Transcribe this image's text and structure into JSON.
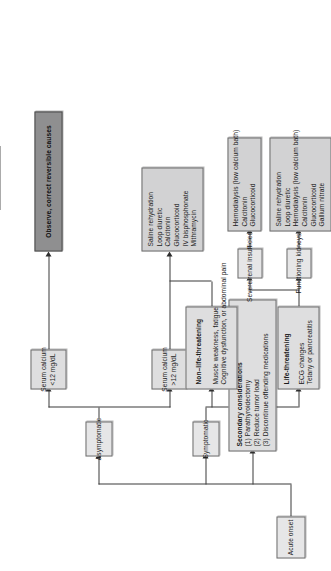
{
  "figure": {
    "orientation": "rotated-90-ccw",
    "colors": {
      "node_fill": "#dededf",
      "node_fill_light": "#e6e6e7",
      "node_fill_dark": "#8f8f90",
      "border": "#6e6e6e",
      "connector": "#3a3a3a",
      "page_edge_bar": "#565656",
      "text": "#1b1b1b"
    }
  },
  "nodes": {
    "acute_onset": {
      "id": "acute-onset",
      "lines": [
        "Acute onset"
      ]
    },
    "secondary_considerations": {
      "id": "secondary-considerations",
      "lines": [
        "Secondary considerations",
        "(1) Parathyroidectomy",
        "(2) Reduce tumor load",
        "(3) Discontinue offending medications"
      ]
    },
    "asymptomatic": {
      "id": "asymptomatic",
      "lines": [
        "Asymptomatic"
      ]
    },
    "symptomatic": {
      "id": "symptomatic",
      "lines": [
        "Symptomatic"
      ]
    },
    "serum_calcium_low": {
      "id": "serum-calcium-low",
      "lines": [
        "Serum calcium",
        "<12 mg/dL"
      ]
    },
    "serum_calcium_high": {
      "id": "serum-calcium-high",
      "lines": [
        "Serum calcium",
        ">12 mg/dL"
      ]
    },
    "observe": {
      "id": "observe-correct-reversible-causes",
      "lines": [
        "Observe, correct reversible causes"
      ]
    },
    "treatment_high_calcium": {
      "id": "treatment-high-calcium",
      "lines": [
        "Saline rehydration",
        "Loop diuretic",
        "Calcitonin",
        "Glucocorticoid",
        "IV bisphosphonate",
        "Mithramycin"
      ]
    },
    "non_life_threatening": {
      "id": "non-life-threatening",
      "heading": "Non–life-threatening",
      "lines": [
        "Muscle weakness, fatigue",
        "Cognitive dysfunction, or abdominal pain"
      ]
    },
    "life_threatening": {
      "id": "life-threatening",
      "heading": "Life-threatening",
      "lines": [
        "ECG changes",
        "Tetany or pancreatitis"
      ]
    },
    "severe_renal_insufficiency": {
      "id": "severe-renal-insufficiency",
      "lines": [
        "Severe renal insufficiency"
      ]
    },
    "functioning_kidneys": {
      "id": "functioning-kidneys",
      "lines": [
        "Functioning kidneys"
      ]
    },
    "treatment_renal": {
      "id": "treatment-severe-renal-insufficiency",
      "lines": [
        "Hemodialysis (low calcium bath)",
        "Calcitonin",
        "Glucocorticoid"
      ]
    },
    "treatment_kidneys": {
      "id": "treatment-functioning-kidneys",
      "lines": [
        "Saline rehydration",
        "Loop diuretic",
        "Hemodialysis (low calcium bath)",
        "Calcitonin",
        "Glucocorticoid",
        "Gallium nitrate"
      ]
    }
  }
}
